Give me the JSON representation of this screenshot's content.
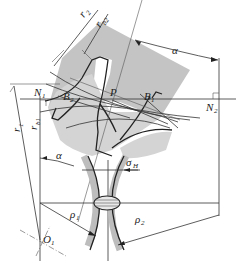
{
  "figure": {
    "colors": {
      "gear_shade": "#c4c4c4",
      "gear_shade_light": "#d4d4d4",
      "line": "#333333",
      "background": "#ffffff"
    },
    "labels": {
      "r2": {
        "main": "r",
        "sub": "2"
      },
      "rb2": {
        "main": "r",
        "sub": "b2"
      },
      "alpha_top": {
        "main": "α"
      },
      "N1": {
        "main": "N",
        "sub": "1"
      },
      "B2": {
        "main": "B",
        "sub": "2"
      },
      "P": {
        "main": "P"
      },
      "B1": {
        "main": "B",
        "sub": "1"
      },
      "N2": {
        "main": "N",
        "sub": "2"
      },
      "r1": {
        "main": "r",
        "sub": "1"
      },
      "rb1": {
        "main": "r",
        "sub": "b1"
      },
      "alpha_bottom": {
        "main": "α"
      },
      "sigma_H": {
        "main": "σ",
        "sub": "H"
      },
      "rho1": {
        "main": "ρ",
        "sub": "1"
      },
      "rho2": {
        "main": "ρ",
        "sub": "2"
      },
      "O1": {
        "main": "O",
        "sub": "1"
      }
    }
  }
}
